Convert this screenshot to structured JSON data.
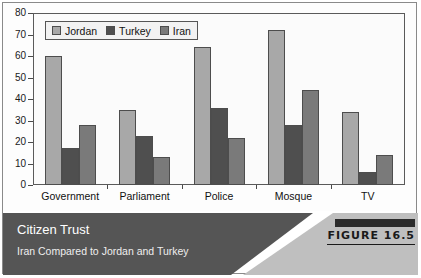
{
  "chart_data": {
    "type": "bar",
    "title": "Citizen Trust",
    "subtitle": "Iran Compared to Jordan and Turkey",
    "xlabel": "",
    "ylabel": "",
    "ylim": [
      0,
      80
    ],
    "ytick_step": 10,
    "yticks": [
      0,
      10,
      20,
      30,
      40,
      50,
      60,
      70,
      80
    ],
    "grid": false,
    "legend_position": "top-left-inside",
    "categories": [
      "Government",
      "Parliament",
      "Police",
      "Mosque",
      "TV"
    ],
    "series": [
      {
        "name": "Jordan",
        "color": "#a8a8a8",
        "values": [
          60,
          35,
          64,
          72,
          34
        ]
      },
      {
        "name": "Turkey",
        "color": "#4f4f4f",
        "values": [
          17,
          23,
          36,
          28,
          6
        ]
      },
      {
        "name": "Iran",
        "color": "#7a7a7a",
        "values": [
          28,
          13,
          22,
          44,
          14
        ]
      }
    ]
  },
  "caption": {
    "title": "Citizen Trust",
    "subtitle": "Iran Compared to Jordan and Turkey",
    "figure_label": "FIGURE 16.5"
  },
  "colors": {
    "caption_bg": "#555555",
    "caption_accent": "#bfbfbf",
    "figure_bar": "#2b2b2b",
    "axis": "#4a4a4a",
    "plot_bg": "#fbfbfb"
  }
}
